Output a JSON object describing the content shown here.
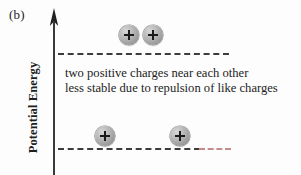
{
  "figure": {
    "panel_label": "(b)",
    "axis": {
      "label": "Potential Energy",
      "arrow_icon": "up-arrow-icon",
      "direction": "up"
    },
    "caption": {
      "line1": "two positive charges near each other",
      "line2": "less stable due to repulsion of like charges"
    },
    "charges": [
      {
        "sign": "+",
        "position": "upper-left",
        "level": "upper"
      },
      {
        "sign": "+",
        "position": "upper-right",
        "level": "upper"
      },
      {
        "sign": "+",
        "position": "lower-left",
        "level": "lower"
      },
      {
        "sign": "+",
        "position": "lower-right",
        "level": "lower"
      }
    ],
    "levels": [
      {
        "name": "upper-energy-level",
        "style": "dashed"
      },
      {
        "name": "lower-energy-level",
        "style": "dashed"
      }
    ],
    "colors": {
      "background": "#fdfdfd",
      "axis": "#3a3a3a",
      "dashed_line": "#3c3c3c",
      "dashed_line_tail": "#c98a8a",
      "charge_body": "#a3a3a3",
      "charge_sign": "#1a1a1a",
      "text": "#1c1c1c"
    }
  }
}
